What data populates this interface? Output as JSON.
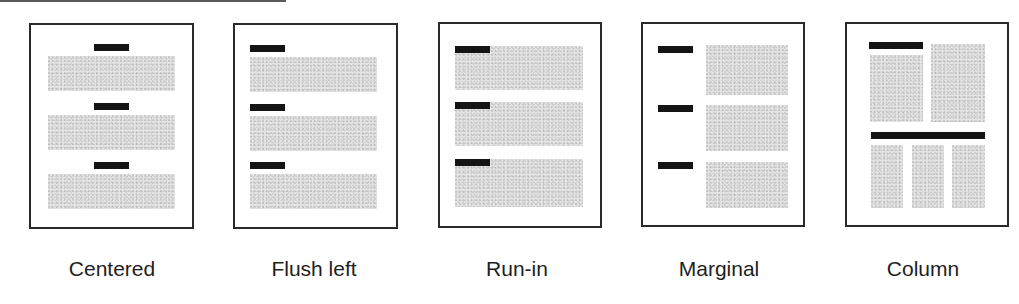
{
  "diagram": {
    "colors": {
      "border": "#2a2a2a",
      "heading_bar": "#141414",
      "text_block": "#e4e4e4",
      "label": "#1e1e1e"
    },
    "panels": [
      {
        "id": "centered",
        "label": "Centered",
        "heading_position": "centered above each text block",
        "heading_count": 3,
        "text_blocks": 3
      },
      {
        "id": "flush-left",
        "label": "Flush left",
        "heading_position": "left-aligned above each text block",
        "heading_count": 3,
        "text_blocks": 3
      },
      {
        "id": "run-in",
        "label": "Run-in",
        "heading_position": "inline at start of first line of text block",
        "heading_count": 3,
        "text_blocks": 3
      },
      {
        "id": "marginal",
        "label": "Marginal",
        "heading_position": "in left margin beside text block",
        "heading_count": 3,
        "text_blocks": 3
      },
      {
        "id": "column",
        "label": "Column",
        "heading_position": "spanning columns above multi-column text",
        "heading_count": 2,
        "text_blocks": 5
      }
    ]
  }
}
